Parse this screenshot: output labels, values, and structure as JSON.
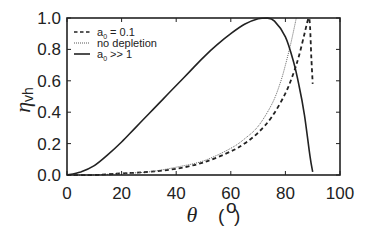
{
  "chart_data": {
    "type": "line",
    "title": "",
    "xlabel": "θ (°)",
    "ylabel": "η_vh",
    "xlim": [
      0,
      100
    ],
    "ylim": [
      0,
      1.0
    ],
    "x_ticks": [
      "0",
      "20",
      "40",
      "60",
      "80",
      "100"
    ],
    "y_ticks": [
      "0.0",
      "0.2",
      "0.4",
      "0.6",
      "0.8",
      "1.0"
    ],
    "grid": false,
    "legend_position": "upper left",
    "series": [
      {
        "name": "a0 = 0.1",
        "style": "dashed",
        "x": [
          0,
          10,
          20,
          30,
          40,
          50,
          60,
          65,
          70,
          75,
          80,
          83,
          85,
          87,
          88.5,
          89,
          89.5,
          90
        ],
        "y": [
          0,
          0.0,
          0.01,
          0.02,
          0.04,
          0.08,
          0.15,
          0.2,
          0.27,
          0.37,
          0.52,
          0.65,
          0.76,
          0.9,
          1.0,
          0.95,
          0.75,
          0.58
        ]
      },
      {
        "name": "no depletion",
        "style": "dotted",
        "x": [
          0,
          10,
          20,
          30,
          40,
          50,
          60,
          65,
          70,
          75,
          78,
          80,
          82,
          84
        ],
        "y": [
          0,
          0.0,
          0.01,
          0.02,
          0.05,
          0.09,
          0.17,
          0.23,
          0.31,
          0.45,
          0.58,
          0.7,
          0.84,
          1.0
        ]
      },
      {
        "name": "a0 >> 1",
        "style": "solid",
        "x": [
          0,
          5,
          10,
          15,
          20,
          25,
          30,
          35,
          40,
          45,
          50,
          55,
          60,
          65,
          70,
          73,
          76,
          80,
          83,
          85,
          87,
          89,
          90
        ],
        "y": [
          0,
          0.02,
          0.06,
          0.13,
          0.21,
          0.3,
          0.39,
          0.48,
          0.57,
          0.66,
          0.75,
          0.83,
          0.9,
          0.96,
          0.995,
          1.0,
          0.98,
          0.88,
          0.72,
          0.57,
          0.38,
          0.12,
          0.02
        ]
      }
    ]
  },
  "legend": [
    {
      "label_main": "a",
      "label_sub": "0",
      "label_rest": " = 0.1"
    },
    {
      "label_main": "no depletion",
      "label_sub": "",
      "label_rest": ""
    },
    {
      "label_main": "a",
      "label_sub": "0",
      "label_rest": " >> 1"
    }
  ],
  "axes": {
    "x_title": "θ",
    "x_unit_open": "(",
    "x_unit_degree": "o",
    "x_unit_close": ")",
    "y_title_main": "η",
    "y_title_sub": "vh"
  }
}
